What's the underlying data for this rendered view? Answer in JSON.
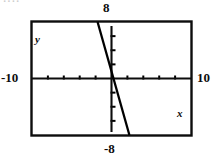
{
  "figure": {
    "top_fragment": "····",
    "viewport_labels": {
      "top": "8",
      "bottom": "-8",
      "left": "-10",
      "right": "10"
    },
    "axis_names": {
      "x": "x",
      "y": "y"
    }
  },
  "chart_data": {
    "type": "line",
    "title": "",
    "subtitle": "",
    "xlabel": "x",
    "ylabel": "y",
    "xlim": [
      -10,
      10
    ],
    "ylim": [
      -8,
      8
    ],
    "grid": false,
    "legend": null,
    "x_tick_labels": [
      "-10",
      "10"
    ],
    "y_tick_labels": [
      "8",
      "-8"
    ],
    "x_tick_interval": 2,
    "y_tick_interval": 2,
    "axis_color": "#000000",
    "line_color": "#000000",
    "background": "#ffffff",
    "series": [
      {
        "name": "line",
        "slope": -4,
        "intercept": 1,
        "x": [
          -3.2,
          3.5
        ],
        "y": [
          13.8,
          -13.0
        ],
        "points": [
          {
            "x": -3.2,
            "y": 8.0
          },
          {
            "x": 0.0,
            "y": 1.0
          },
          {
            "x": 0.25,
            "y": 0.0
          },
          {
            "x": 2.25,
            "y": -8.0
          }
        ]
      }
    ]
  }
}
